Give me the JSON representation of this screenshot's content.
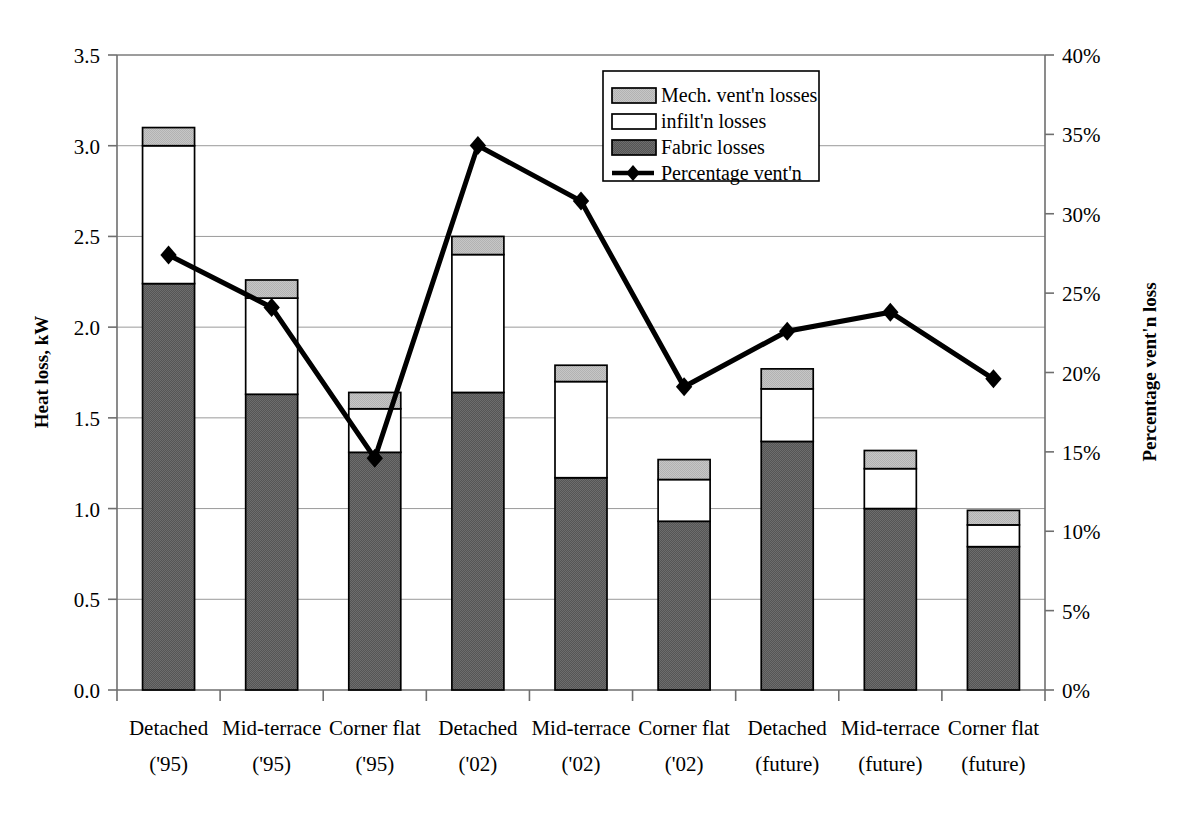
{
  "chart_data": {
    "type": "bar",
    "subtype": "stacked-bar-with-line-overlay",
    "title": "",
    "xlabel": "",
    "ylabel": "Heat loss, kW",
    "y2label": "Percentage vent'n loss",
    "ylim": [
      0,
      3.5
    ],
    "y2lim": [
      0,
      40
    ],
    "ytick_labels": [
      "0.0",
      "0.5",
      "1.0",
      "1.5",
      "2.0",
      "2.5",
      "3.0",
      "3.5"
    ],
    "ytick_values": [
      0,
      0.5,
      1.0,
      1.5,
      2.0,
      2.5,
      3.0,
      3.5
    ],
    "y2tick_labels": [
      "0%",
      "5%",
      "10%",
      "15%",
      "20%",
      "25%",
      "30%",
      "35%",
      "40%"
    ],
    "y2tick_values": [
      0,
      5,
      10,
      15,
      20,
      25,
      30,
      35,
      40
    ],
    "grid": true,
    "legend_position": "top-center",
    "categories": [
      "Detached\n('95)",
      "Mid-terrace\n('95)",
      "Corner flat\n('95)",
      "Detached\n('02)",
      "Mid-terrace\n('02)",
      "Corner flat\n('02)",
      "Detached\n(future)",
      "Mid-terrace\n(future)",
      "Corner flat\n(future)"
    ],
    "category_lines": [
      [
        "Detached",
        "('95)"
      ],
      [
        "Mid-terrace",
        "('95)"
      ],
      [
        "Corner flat",
        "('95)"
      ],
      [
        "Detached",
        "('02)"
      ],
      [
        "Mid-terrace",
        "('02)"
      ],
      [
        "Corner flat",
        "('02)"
      ],
      [
        "Detached",
        "(future)"
      ],
      [
        "Mid-terrace",
        "(future)"
      ],
      [
        "Corner flat",
        "(future)"
      ]
    ],
    "series": [
      {
        "name": "Fabric losses",
        "kind": "bar-segment",
        "color": "#595959",
        "values": [
          2.24,
          1.63,
          1.31,
          1.64,
          1.17,
          0.93,
          1.37,
          1.0,
          0.79
        ]
      },
      {
        "name": "infilt'n losses",
        "kind": "bar-segment",
        "color": "#ffffff",
        "values": [
          0.76,
          0.53,
          0.24,
          0.76,
          0.53,
          0.23,
          0.29,
          0.22,
          0.12
        ]
      },
      {
        "name": "Mech. vent'n losses",
        "kind": "bar-segment",
        "color": "#bfbfbf",
        "values": [
          0.1,
          0.1,
          0.09,
          0.1,
          0.09,
          0.11,
          0.11,
          0.1,
          0.08
        ]
      },
      {
        "name": "Percentage vent'n",
        "kind": "line",
        "axis": "secondary",
        "color": "#000000",
        "marker": "diamond",
        "values": [
          27.4,
          24.1,
          14.6,
          34.3,
          30.8,
          19.1,
          22.6,
          23.8,
          19.6
        ]
      }
    ],
    "bar_totals": [
      3.1,
      2.26,
      1.64,
      2.5,
      1.79,
      1.27,
      1.77,
      1.32,
      0.99
    ],
    "cumulative_tops": {
      "fabric": [
        2.24,
        1.63,
        1.31,
        1.64,
        1.17,
        0.93,
        1.37,
        1.0,
        0.79
      ],
      "infiltration": [
        3.0,
        2.16,
        1.55,
        2.4,
        1.7,
        1.16,
        1.66,
        1.22,
        0.91
      ],
      "mech_vent": [
        3.1,
        2.26,
        1.64,
        2.5,
        1.79,
        1.27,
        1.77,
        1.32,
        0.99
      ]
    }
  },
  "legend": {
    "entries": [
      {
        "label": "Mech. vent'n losses",
        "swatch": "light-gray-swatch"
      },
      {
        "label": "infilt'n losses",
        "swatch": "white-swatch"
      },
      {
        "label": "Fabric losses",
        "swatch": "dark-gray-swatch"
      },
      {
        "label": "Percentage vent'n",
        "swatch": "line-diamond-swatch"
      }
    ]
  },
  "axes": {
    "left_title": "Heat loss, kW",
    "right_title": "Percentage vent'n loss"
  },
  "colors": {
    "fabric": "#595959",
    "infiltration": "#ffffff",
    "mech_vent": "#bfbfbf",
    "line": "#000000",
    "grid": "#9a9a9a",
    "outline": "#000000"
  }
}
